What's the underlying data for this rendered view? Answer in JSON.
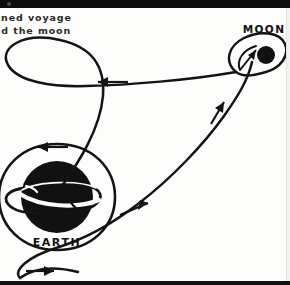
{
  "figure": {
    "caption_line_1": "anned voyage",
    "caption_line_2": "und the moon",
    "caption_full_intended": "Manned voyage around the moon",
    "background_color": "#fdfdfb",
    "ink_color": "#111111"
  },
  "bodies": {
    "earth": {
      "label": "EARTH",
      "fill_color": "#111111",
      "center": [
        57,
        197
      ],
      "radius": 36,
      "has_orbit_ring": true,
      "has_surrounding_orbit_circle": true
    },
    "moon": {
      "label": "MOON",
      "fill_color": "#111111",
      "center": [
        266,
        57
      ],
      "radius": 9,
      "has_loop_trajectory": true
    }
  },
  "trajectory": {
    "name": "free-return trajectory",
    "stroke_color": "#141414",
    "arrows": [
      {
        "name": "arrow-earth-orbit-top",
        "label": "",
        "direction": "left",
        "x": 48,
        "y": 145
      },
      {
        "name": "arrow-outbound-upper",
        "label": "",
        "direction": "left",
        "x": 111,
        "y": 84
      },
      {
        "name": "arrow-inbound-diagonal",
        "label": "",
        "direction": "up-right",
        "x": 218,
        "y": 110
      },
      {
        "name": "arrow-lower-curve",
        "label": "",
        "direction": "up-right",
        "x": 139,
        "y": 208
      },
      {
        "name": "arrow-bottom-return",
        "label": "",
        "direction": "right",
        "x": 43,
        "y": 270
      },
      {
        "name": "arrow-moon-loop",
        "label": "",
        "direction": "up-right",
        "x": 250,
        "y": 68
      }
    ]
  },
  "labels": {
    "earth_label_pos": [
      57,
      243
    ],
    "moon_label_pos": [
      266,
      31
    ]
  }
}
